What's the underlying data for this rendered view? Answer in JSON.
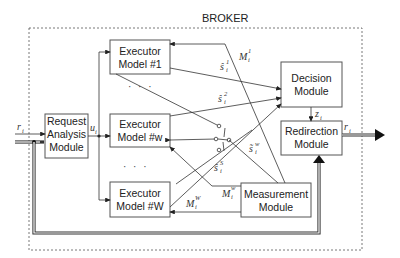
{
  "diagram": {
    "title": "BROKER",
    "blocks": {
      "request_analysis": [
        "Request",
        "Analysis",
        "Module"
      ],
      "executor_1": [
        "Executor",
        "Model #1"
      ],
      "executor_w": [
        "Executor",
        "Model #w"
      ],
      "executor_W": [
        "Executor",
        "Model #W"
      ],
      "decision": [
        "Decision",
        "Module"
      ],
      "redirection": [
        "Redirection",
        "Module"
      ],
      "measurement": [
        "Measurement",
        "Module"
      ]
    },
    "ellipsis": "· · ·",
    "signals": {
      "input": {
        "base": "r",
        "sub": "i"
      },
      "output": {
        "base": "r",
        "sub": "i"
      },
      "u": {
        "base": "u",
        "sub": "i"
      },
      "z": {
        "base": "z",
        "sub": "i"
      },
      "s1": {
        "base": "ŝ",
        "sub": "i",
        "sup": "1"
      },
      "s2": {
        "base": "ŝ",
        "sub": "i",
        "sup": "2"
      },
      "sS": {
        "base": "ŝ",
        "sub": "i",
        "sup": "S"
      },
      "sw": {
        "base": "s̃",
        "sub": "i",
        "sup": "w"
      },
      "M1": {
        "base": "M",
        "sub": "i",
        "sup": "1"
      },
      "Mw": {
        "base": "M",
        "sub": "i",
        "sup": "w"
      },
      "MW": {
        "base": "M",
        "sub": "i",
        "sup": "W"
      }
    }
  }
}
